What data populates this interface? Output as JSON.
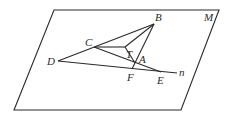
{
  "figure": {
    "plane_label": "M",
    "line_label": "n",
    "points": {
      "B": {
        "label": "B",
        "x": 154,
        "y": 24
      },
      "C": {
        "label": "C",
        "x": 94,
        "y": 47
      },
      "T": {
        "label": "T",
        "x": 125,
        "y": 47
      },
      "A": {
        "label": "A",
        "x": 135,
        "y": 63
      },
      "D": {
        "label": "D",
        "x": 58,
        "y": 61
      },
      "F": {
        "label": "F",
        "x": 132,
        "y": 69
      },
      "E": {
        "label": "E",
        "x": 161,
        "y": 72
      }
    },
    "plane_corners": [
      {
        "x": 54,
        "y": 10
      },
      {
        "x": 219,
        "y": 10
      },
      {
        "x": 181,
        "y": 110
      },
      {
        "x": 14,
        "y": 110
      }
    ],
    "line_n_end": {
      "x": 177,
      "y": 73
    },
    "colors": {
      "stroke": "#2a2a2a",
      "background": "#ffffff"
    }
  }
}
